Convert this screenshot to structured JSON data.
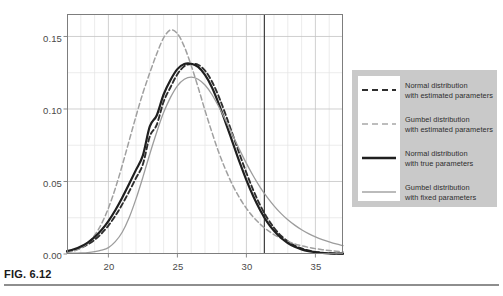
{
  "figure": {
    "caption_label": "FIG. 6.12"
  },
  "chart_data": {
    "type": "line",
    "title": "",
    "xlabel": "",
    "ylabel": "",
    "xlim": [
      17.0,
      37.0
    ],
    "ylim": [
      0.0,
      0.1655
    ],
    "grid": true,
    "grid_major_color": "#c4c4c4",
    "grid_minor_color": "#e4e4e4",
    "frame_color": "#7d7d7d",
    "background": "#ffffff",
    "x_ticks": [
      20,
      25,
      30,
      35
    ],
    "x_tick_labels": [
      "20",
      "25",
      "30",
      "35"
    ],
    "x_minor_ticks": [
      18,
      19,
      21,
      22,
      23,
      24,
      26,
      27,
      28,
      29,
      31,
      32,
      33,
      34,
      36,
      37
    ],
    "y_ticks": [
      0.0,
      0.05,
      0.1,
      0.15
    ],
    "y_tick_labels": [
      "0.00",
      "0.05",
      "0.10",
      "0.15"
    ],
    "y_minor_ticks": [
      0.025,
      0.075,
      0.125
    ],
    "annotations": [
      {
        "name": "threshold-line",
        "type": "vline",
        "x": 31.3,
        "color": "#2b2b2b",
        "width": 1.1
      }
    ],
    "legend_position": "right-outside",
    "series": [
      {
        "name": "Normal distribution with estimated parameters",
        "style": "dashed",
        "color": "#2e2e2e",
        "width": 1.9,
        "dash": "5,3",
        "peak_x": 26.2,
        "peak_y": 0.131,
        "x": [
          17.0,
          17.5,
          18.0,
          18.5,
          19.0,
          19.5,
          20.0,
          20.5,
          21.0,
          21.5,
          22.0,
          22.5,
          23.0,
          23.5,
          24.0,
          24.5,
          25.0,
          25.5,
          26.0,
          26.5,
          27.0,
          27.5,
          28.0,
          28.5,
          29.0,
          29.5,
          30.0,
          30.5,
          31.0,
          31.5,
          32.0,
          32.5,
          33.0,
          33.5,
          34.0,
          34.5,
          35.0,
          35.5,
          36.0,
          36.5,
          37.0
        ],
        "y": [
          0.0016,
          0.0027,
          0.0043,
          0.0066,
          0.0098,
          0.0141,
          0.0196,
          0.0263,
          0.0342,
          0.043,
          0.0524,
          0.0619,
          0.0811,
          0.089,
          0.105,
          0.115,
          0.124,
          0.1295,
          0.131,
          0.1305,
          0.1265,
          0.119,
          0.1085,
          0.096,
          0.0825,
          0.069,
          0.056,
          0.044,
          0.0336,
          0.025,
          0.0181,
          0.0127,
          0.0087,
          0.0058,
          0.0038,
          0.0024,
          0.0015,
          0.0009,
          0.0005,
          0.0003,
          0.0002
        ]
      },
      {
        "name": "Gumbel distribution with estimated parameters",
        "style": "dashed",
        "color": "#a0a0a0",
        "width": 1.5,
        "dash": "5,3",
        "peak_x": 24.8,
        "peak_y": 0.155,
        "x": [
          17.0,
          17.5,
          18.0,
          18.5,
          19.0,
          19.5,
          20.0,
          20.5,
          21.0,
          21.5,
          22.0,
          22.5,
          23.0,
          23.5,
          24.0,
          24.5,
          25.0,
          25.5,
          26.0,
          26.5,
          27.0,
          27.5,
          28.0,
          28.5,
          29.0,
          29.5,
          30.0,
          30.5,
          31.0,
          31.5,
          32.0,
          32.5,
          33.0,
          33.5,
          34.0,
          34.5,
          35.0,
          35.5,
          36.0,
          36.5,
          37.0
        ],
        "y": [
          0.001,
          0.0021,
          0.0041,
          0.0075,
          0.0129,
          0.0208,
          0.0316,
          0.0452,
          0.061,
          0.078,
          0.095,
          0.111,
          0.125,
          0.138,
          0.149,
          0.1545,
          0.152,
          0.143,
          0.13,
          0.115,
          0.099,
          0.084,
          0.07,
          0.058,
          0.0475,
          0.0388,
          0.0315,
          0.0255,
          0.0206,
          0.0166,
          0.0134,
          0.0108,
          0.0087,
          0.007,
          0.0057,
          0.0046,
          0.0037,
          0.003,
          0.0024,
          0.0019,
          0.0016
        ]
      },
      {
        "name": "Normal distribution with true parameters",
        "style": "solid",
        "color": "#1f1f1f",
        "width": 2.2,
        "dash": "",
        "peak_x": 26.0,
        "peak_y": 0.131,
        "x": [
          17.0,
          17.5,
          18.0,
          18.5,
          19.0,
          19.5,
          20.0,
          20.5,
          21.0,
          21.5,
          22.0,
          22.5,
          23.0,
          23.5,
          24.0,
          24.5,
          25.0,
          25.5,
          26.0,
          26.5,
          27.0,
          27.5,
          28.0,
          28.5,
          29.0,
          29.5,
          30.0,
          30.5,
          31.0,
          31.5,
          32.0,
          32.5,
          33.0,
          33.5,
          34.0,
          34.5,
          35.0,
          35.5,
          36.0,
          36.5,
          37.0
        ],
        "y": [
          0.002,
          0.0033,
          0.0052,
          0.0079,
          0.0116,
          0.0165,
          0.0227,
          0.0302,
          0.0388,
          0.0482,
          0.058,
          0.068,
          0.088,
          0.0955,
          0.11,
          0.12,
          0.1275,
          0.131,
          0.1312,
          0.129,
          0.1235,
          0.115,
          0.1035,
          0.0905,
          0.077,
          0.0635,
          0.051,
          0.0398,
          0.0302,
          0.0222,
          0.016,
          0.0112,
          0.0076,
          0.005,
          0.0032,
          0.002,
          0.0012,
          0.0007,
          0.0004,
          0.0003,
          0.0002
        ]
      },
      {
        "name": "Gumbel distribution with fixed parameters",
        "style": "solid",
        "color": "#9d9d9d",
        "width": 1.3,
        "dash": "",
        "peak_x": 25.8,
        "peak_y": 0.122,
        "x": [
          17.0,
          17.5,
          18.0,
          18.5,
          19.0,
          19.5,
          20.0,
          20.5,
          21.0,
          21.5,
          22.0,
          22.5,
          23.0,
          23.5,
          24.0,
          24.5,
          25.0,
          25.5,
          26.0,
          26.5,
          27.0,
          27.5,
          28.0,
          28.5,
          29.0,
          29.5,
          30.0,
          30.5,
          31.0,
          31.5,
          32.0,
          32.5,
          33.0,
          33.5,
          34.0,
          34.5,
          35.0,
          35.5,
          36.0,
          36.5,
          37.0
        ],
        "y": [
          0.0004,
          0.0005,
          0.0007,
          0.001,
          0.0016,
          0.0026,
          0.0044,
          0.0085,
          0.015,
          0.025,
          0.038,
          0.053,
          0.069,
          0.084,
          0.0975,
          0.108,
          0.116,
          0.1205,
          0.122,
          0.1205,
          0.1165,
          0.11,
          0.1015,
          0.092,
          0.082,
          0.072,
          0.0625,
          0.0538,
          0.046,
          0.0392,
          0.0332,
          0.028,
          0.0236,
          0.0199,
          0.0167,
          0.014,
          0.0118,
          0.0099,
          0.0083,
          0.0069,
          0.0058
        ]
      }
    ]
  },
  "legend": {
    "entries": [
      {
        "line1": "Normal distribution",
        "line2": "with estimated parameters",
        "swatch": "dashed-dark"
      },
      {
        "line1": "Gumbel distribution",
        "line2": "with estimated parameters",
        "swatch": "dashed-gray"
      },
      {
        "line1": "Normal distribution",
        "line2": "with true parameters",
        "swatch": "solid-dark-thick"
      },
      {
        "line1": "Gumbel distribution",
        "line2": "with fixed parameters",
        "swatch": "solid-gray-thin"
      }
    ]
  },
  "axis_labels": {
    "y": [
      "0.15",
      "0.10",
      "0.05",
      "0.00"
    ],
    "x": [
      "20",
      "25",
      "30",
      "35"
    ]
  }
}
